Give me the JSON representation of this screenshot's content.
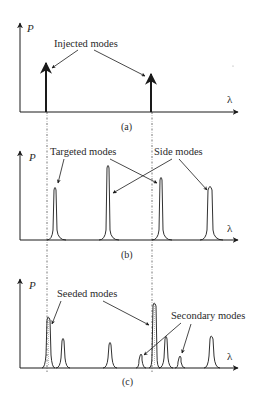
{
  "figure": {
    "panels": [
      {
        "id": "a",
        "caption": "(a)",
        "y_axis_label": "P",
        "x_axis_label": "λ",
        "annotations": [
          {
            "text": "Injected modes"
          }
        ]
      },
      {
        "id": "b",
        "caption": "(b)",
        "y_axis_label": "P",
        "x_axis_label": "λ",
        "annotations": [
          {
            "text": "Targeted modes"
          },
          {
            "text": "Side modes"
          }
        ]
      },
      {
        "id": "c",
        "caption": "(c)",
        "y_axis_label": "P",
        "x_axis_label": "λ",
        "annotations": [
          {
            "text": "Seeded modes"
          },
          {
            "text": "Secondary modes"
          }
        ]
      }
    ],
    "colors": {
      "line": "#1a1a1a",
      "dashed": "#555555",
      "background": "#ffffff"
    }
  }
}
